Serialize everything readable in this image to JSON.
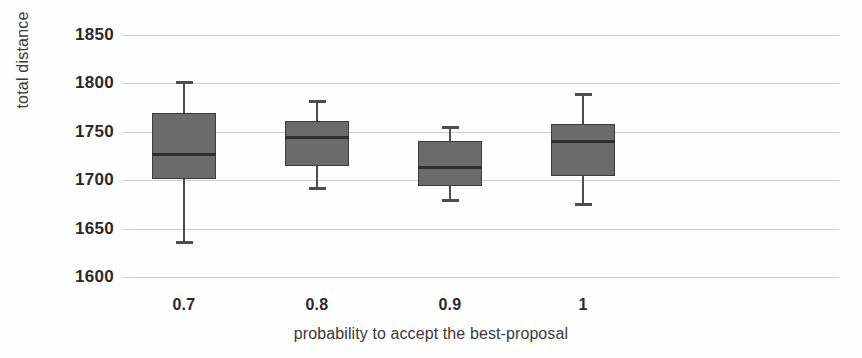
{
  "chart_data": {
    "type": "box",
    "title": "",
    "xlabel": "probability to accept the best-proposal",
    "ylabel": "total distance",
    "categories": [
      "0.7",
      "0.8",
      "0.9",
      "1"
    ],
    "ytick_labels": [
      "1850",
      "1800",
      "1750",
      "1700",
      "1650",
      "1600"
    ],
    "ytick_values": [
      1850,
      1800,
      1750,
      1700,
      1650,
      1600
    ],
    "ylim": [
      1600,
      1850
    ],
    "grid": "horizontal",
    "legend": "none",
    "box_color": "#6b6b6b",
    "line_color": "#3b3b3b",
    "grid_color": "#c9cdd2",
    "boxes": [
      {
        "category": "0.7",
        "whisker_low": 1634,
        "q1": 1701,
        "median": 1727,
        "q3": 1769,
        "whisker_high": 1802
      },
      {
        "category": "0.8",
        "whisker_low": 1690,
        "q1": 1715,
        "median": 1744,
        "q3": 1761,
        "whisker_high": 1783
      },
      {
        "category": "0.9",
        "whisker_low": 1677,
        "q1": 1694,
        "median": 1713,
        "q3": 1740,
        "whisker_high": 1756
      },
      {
        "category": "1",
        "whisker_low": 1673,
        "q1": 1704,
        "median": 1740,
        "q3": 1758,
        "whisker_high": 1790
      }
    ]
  }
}
